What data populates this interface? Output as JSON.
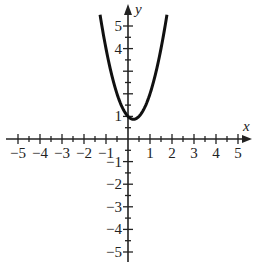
{
  "chart_data": {
    "type": "line",
    "title": "",
    "xlabel": "x",
    "ylabel": "y",
    "xlim": [
      -5,
      5
    ],
    "ylim": [
      -5,
      5
    ],
    "grid": false,
    "x_tick_labels": [
      "-5",
      "-4",
      "-3",
      "-2",
      "-1",
      "1",
      "2",
      "3",
      "4",
      "5"
    ],
    "y_tick_labels": [
      "5",
      "4",
      "1",
      "-1",
      "-2",
      "-3",
      "-4",
      "-5"
    ],
    "minor_ticks_per_unit": 2,
    "series": [
      {
        "name": "parabola",
        "description": "upward-opening parabola with vertex near (0.25, 0.9)",
        "x": [
          -1.27,
          -1.0,
          -0.75,
          -0.5,
          -0.25,
          0.0,
          0.25,
          0.5,
          0.75,
          1.0,
          1.25,
          1.5,
          1.77
        ],
        "y": [
          5.5,
          4.0,
          2.9,
          2.0,
          1.4,
          1.0,
          0.9,
          1.0,
          1.4,
          2.0,
          2.9,
          4.0,
          5.5
        ]
      }
    ],
    "color": "#111111"
  },
  "axis": {
    "x_name": "x",
    "y_name": "y"
  }
}
